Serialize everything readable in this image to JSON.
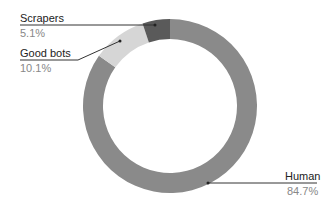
{
  "chart_data": {
    "type": "pie",
    "variant": "donut",
    "title": "",
    "categories": [
      "Human",
      "Good bots",
      "Scrapers"
    ],
    "values": [
      84.7,
      10.1,
      5.1
    ],
    "labels": [
      "84.7%",
      "10.1%",
      "5.1%"
    ],
    "colors": [
      "#8a8a8a",
      "#d6d6d6",
      "#5a5a5a"
    ],
    "start_angle": "top, clockwise",
    "legend": "callout labels"
  },
  "labels": {
    "scrapers": {
      "name": "Scrapers",
      "value": "5.1%"
    },
    "good_bots": {
      "name": "Good bots",
      "value": "10.1%"
    },
    "human": {
      "name": "Human",
      "value": "84.7%"
    }
  }
}
